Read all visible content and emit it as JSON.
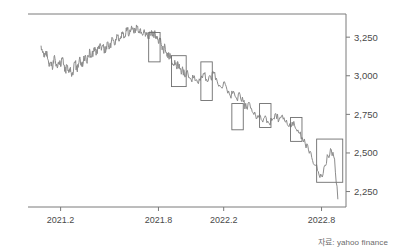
{
  "source_note": "자료: yahoo finance",
  "chart_data": {
    "type": "line",
    "title": "",
    "xlabel": "",
    "ylabel": "",
    "grid": false,
    "legend": "none",
    "axis_side": "right",
    "xlim": [
      2021.0,
      2022.95
    ],
    "ylim": [
      2150,
      3400
    ],
    "y_ticks": [
      3250,
      3000,
      2750,
      2500,
      2250
    ],
    "y_tick_labels": [
      "3,250",
      "3,000",
      "2,750",
      "2,500",
      "2,250"
    ],
    "x_ticks": [
      2021.2,
      2021.8,
      2022.2,
      2022.8
    ],
    "x_tick_labels": [
      "2021.2",
      "2021.8",
      "2022.2",
      "2022.8"
    ],
    "line_color": "#8c8c8c",
    "box_color": "#6e6e6e",
    "axis_color": "#7a7a7a",
    "series": [
      {
        "name": "index",
        "x": [
          2021.08,
          2021.09,
          2021.1,
          2021.11,
          2021.12,
          2021.13,
          2021.14,
          2021.15,
          2021.16,
          2021.17,
          2021.18,
          2021.19,
          2021.2,
          2021.21,
          2021.22,
          2021.23,
          2021.24,
          2021.25,
          2021.26,
          2021.27,
          2021.28,
          2021.29,
          2021.3,
          2021.31,
          2021.32,
          2021.33,
          2021.34,
          2021.35,
          2021.36,
          2021.37,
          2021.38,
          2021.39,
          2021.4,
          2021.41,
          2021.42,
          2021.43,
          2021.44,
          2021.45,
          2021.46,
          2021.47,
          2021.48,
          2021.49,
          2021.5,
          2021.51,
          2021.52,
          2021.53,
          2021.54,
          2021.55,
          2021.56,
          2021.57,
          2021.58,
          2021.59,
          2021.6,
          2021.61,
          2021.62,
          2021.63,
          2021.64,
          2021.65,
          2021.66,
          2021.67,
          2021.68,
          2021.69,
          2021.7,
          2021.71,
          2021.72,
          2021.73,
          2021.74,
          2021.75,
          2021.76,
          2021.77,
          2021.78,
          2021.79,
          2021.8,
          2021.81,
          2021.82,
          2021.83,
          2021.84,
          2021.85,
          2021.86,
          2021.87,
          2021.88,
          2021.89,
          2021.9,
          2021.91,
          2021.92,
          2021.93,
          2021.94,
          2021.95,
          2021.96,
          2021.97,
          2022.0,
          2022.02,
          2022.04,
          2022.06,
          2022.08,
          2022.1,
          2022.12,
          2022.14,
          2022.16,
          2022.18,
          2022.2,
          2022.22,
          2022.24,
          2022.26,
          2022.28,
          2022.3,
          2022.32,
          2022.34,
          2022.36,
          2022.38,
          2022.4,
          2022.42,
          2022.44,
          2022.46,
          2022.48,
          2022.5,
          2022.52,
          2022.54,
          2022.56,
          2022.58,
          2022.6,
          2022.62,
          2022.64,
          2022.66,
          2022.68,
          2022.7,
          2022.72,
          2022.74,
          2022.76,
          2022.78,
          2022.8,
          2022.82,
          2022.84,
          2022.86,
          2022.88,
          2022.9
        ],
        "values": [
          3195,
          3150,
          3120,
          3160,
          3110,
          3060,
          3090,
          3040,
          3125,
          3075,
          3050,
          3090,
          3060,
          3110,
          3070,
          3030,
          3065,
          3020,
          3055,
          3010,
          3050,
          3085,
          3040,
          3075,
          3110,
          3060,
          3095,
          3130,
          3090,
          3125,
          3160,
          3120,
          3150,
          3185,
          3145,
          3175,
          3205,
          3165,
          3195,
          3160,
          3190,
          3220,
          3180,
          3210,
          3240,
          3200,
          3230,
          3260,
          3225,
          3255,
          3285,
          3250,
          3280,
          3300,
          3265,
          3290,
          3310,
          3275,
          3300,
          3320,
          3285,
          3305,
          3270,
          3290,
          3255,
          3280,
          3245,
          3265,
          3290,
          3255,
          3275,
          3240,
          3210,
          3235,
          3190,
          3160,
          3195,
          3150,
          3120,
          3145,
          3105,
          3075,
          3100,
          3060,
          3085,
          3045,
          3010,
          3040,
          2995,
          3020,
          2975,
          3000,
          2955,
          2985,
          3010,
          2960,
          2990,
          3015,
          2965,
          2930,
          2960,
          2910,
          2870,
          2900,
          2850,
          2880,
          2830,
          2790,
          2820,
          2760,
          2720,
          2750,
          2700,
          2730,
          2690,
          2720,
          2755,
          2715,
          2745,
          2700,
          2670,
          2700,
          2660,
          2630,
          2600,
          2560,
          2520,
          2470,
          2420,
          2380,
          2350,
          2420,
          2480,
          2520,
          2460,
          2200
        ]
      }
    ],
    "highlight_boxes": [
      {
        "label": "box-1",
        "x0": 2021.74,
        "x1": 2021.81,
        "y0": 3090,
        "y1": 3280
      },
      {
        "label": "box-2",
        "x0": 2021.88,
        "x1": 2021.97,
        "y0": 2930,
        "y1": 3130
      },
      {
        "label": "box-3",
        "x0": 2022.06,
        "x1": 2022.13,
        "y0": 2840,
        "y1": 3090
      },
      {
        "label": "box-4",
        "x0": 2022.25,
        "x1": 2022.32,
        "y0": 2650,
        "y1": 2820
      },
      {
        "label": "box-5",
        "x0": 2022.42,
        "x1": 2022.49,
        "y0": 2665,
        "y1": 2820
      },
      {
        "label": "box-6",
        "x0": 2022.61,
        "x1": 2022.68,
        "y0": 2575,
        "y1": 2730
      },
      {
        "label": "box-7",
        "x0": 2022.77,
        "x1": 2022.93,
        "y0": 2310,
        "y1": 2590
      }
    ]
  }
}
